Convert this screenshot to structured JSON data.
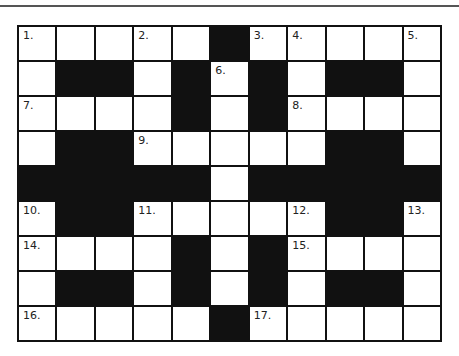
{
  "puzzle": {
    "rows": 9,
    "cols": 11,
    "layout": [
      "WWWWWBWWWWW",
      "WBBWBWBWBBW",
      "WWWWBWBWWWW",
      "WBBWWWWWBBW",
      "BBBBBWBBBBB",
      "WBBWWWWWBBW",
      "WWWWBWBWWWW",
      "WBBWBWBWBBW",
      "WWWWWBWWWWW"
    ],
    "numbers": [
      {
        "row": 0,
        "col": 0,
        "label": "1."
      },
      {
        "row": 0,
        "col": 3,
        "label": "2."
      },
      {
        "row": 0,
        "col": 6,
        "label": "3."
      },
      {
        "row": 0,
        "col": 7,
        "label": "4."
      },
      {
        "row": 0,
        "col": 10,
        "label": "5."
      },
      {
        "row": 1,
        "col": 5,
        "label": "6."
      },
      {
        "row": 2,
        "col": 0,
        "label": "7."
      },
      {
        "row": 2,
        "col": 7,
        "label": "8."
      },
      {
        "row": 3,
        "col": 3,
        "label": "9."
      },
      {
        "row": 5,
        "col": 0,
        "label": "10."
      },
      {
        "row": 5,
        "col": 3,
        "label": "11."
      },
      {
        "row": 5,
        "col": 7,
        "label": "12."
      },
      {
        "row": 5,
        "col": 10,
        "label": "13."
      },
      {
        "row": 6,
        "col": 0,
        "label": "14."
      },
      {
        "row": 6,
        "col": 7,
        "label": "15."
      },
      {
        "row": 8,
        "col": 0,
        "label": "16."
      },
      {
        "row": 8,
        "col": 6,
        "label": "17."
      }
    ]
  },
  "colors": {
    "black_cell": "#111111",
    "white_cell": "#ffffff"
  }
}
